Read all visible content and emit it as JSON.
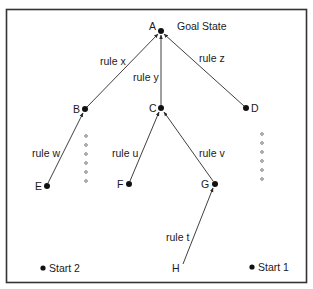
{
  "diagram": {
    "title": "Goal State",
    "colors": {
      "line": "#2a2a2a",
      "frame": "#333333",
      "background": "#ffffff"
    },
    "nodes": [
      {
        "id": "A",
        "label": "A",
        "x": 161,
        "y": 31
      },
      {
        "id": "B",
        "label": "B",
        "x": 85,
        "y": 109
      },
      {
        "id": "C",
        "label": "C",
        "x": 161,
        "y": 108
      },
      {
        "id": "D",
        "label": "D",
        "x": 246,
        "y": 108
      },
      {
        "id": "E",
        "label": "E",
        "x": 47,
        "y": 186
      },
      {
        "id": "F",
        "label": "F",
        "x": 129,
        "y": 184
      },
      {
        "id": "G",
        "label": "G",
        "x": 215,
        "y": 184
      },
      {
        "id": "H",
        "label": "H",
        "x": 181,
        "y": 266
      }
    ],
    "edges": [
      {
        "from": "B",
        "to": "A",
        "label": "rule x"
      },
      {
        "from": "C",
        "to": "A",
        "label": "rule y"
      },
      {
        "from": "D",
        "to": "A",
        "label": "rule z"
      },
      {
        "from": "E",
        "to": "B",
        "label": "rule w"
      },
      {
        "from": "F",
        "to": "C",
        "label": "rule u"
      },
      {
        "from": "G",
        "to": "C",
        "label": "rule v"
      },
      {
        "from": "H",
        "to": "G",
        "label": "rule t"
      }
    ],
    "starts": [
      {
        "label": "Start 2",
        "x": 43,
        "y": 268
      },
      {
        "label": "Start 1",
        "x": 252,
        "y": 267
      }
    ],
    "goal_label": "Goal State"
  }
}
